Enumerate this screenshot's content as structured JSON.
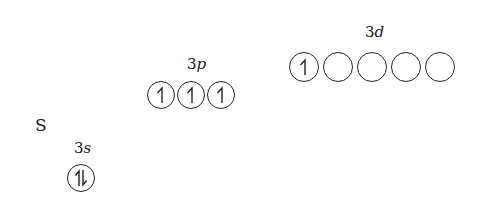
{
  "atom": "S",
  "subshells": [
    {
      "label_n": "3",
      "label_l": "s",
      "orbitals": [
        "paired"
      ]
    },
    {
      "label_n": "3",
      "label_l": "p",
      "orbitals": [
        "up",
        "up",
        "up"
      ]
    },
    {
      "label_n": "3",
      "label_l": "d",
      "orbitals": [
        "up",
        "empty",
        "empty",
        "empty",
        "empty"
      ]
    }
  ],
  "icons": {
    "up": "half-arrow-up-icon",
    "paired": "paired-arrows-icon",
    "empty": "empty-orbital"
  }
}
